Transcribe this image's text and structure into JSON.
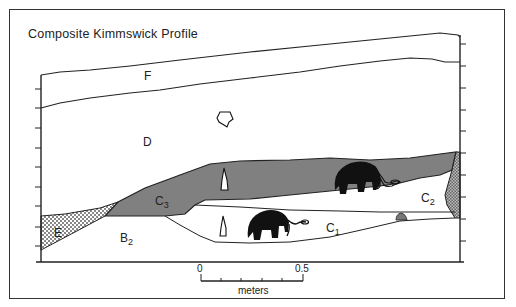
{
  "title": "Composite Kimmswick Profile",
  "layers": [
    {
      "id": "F",
      "label": "F",
      "subscript": ""
    },
    {
      "id": "D",
      "label": "D",
      "subscript": ""
    },
    {
      "id": "C3",
      "label": "C",
      "subscript": "3"
    },
    {
      "id": "C2",
      "label": "C",
      "subscript": "2"
    },
    {
      "id": "C1",
      "label": "C",
      "subscript": "1"
    },
    {
      "id": "B2",
      "label": "B",
      "subscript": "2"
    },
    {
      "id": "E",
      "label": "E",
      "subscript": ""
    }
  ],
  "scale_bar": {
    "start_label": "0",
    "end_label": "0.5",
    "unit_label": "meters"
  },
  "colors": {
    "c3_fill": "#808080",
    "outline": "#222222",
    "hatch": "#999999",
    "mammoth": "#111111"
  }
}
